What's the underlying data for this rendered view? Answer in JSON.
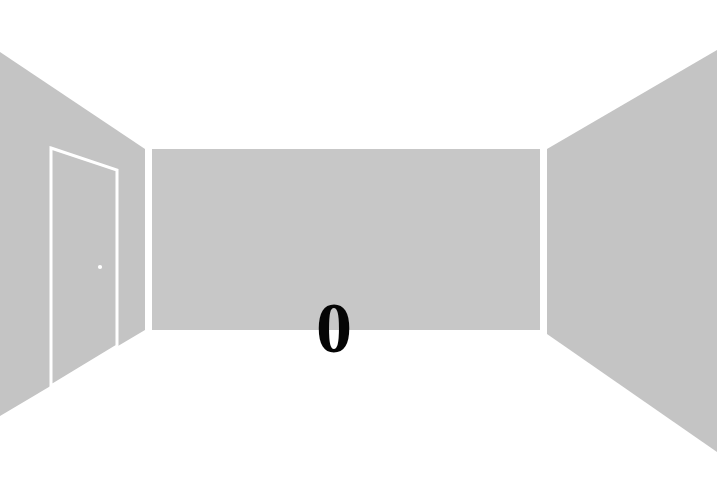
{
  "scene": {
    "title": "Empty room interior perspective",
    "canvas": {
      "width": 717,
      "height": 486
    },
    "background_color": "#ffffff",
    "floor_color": "#ffffff",
    "ceiling_color": "#ffffff"
  },
  "walls": {
    "back": {
      "name": "back-wall",
      "color": "#c7c7c7",
      "points": "152,149 540,149 540,330 152,330"
    },
    "left": {
      "name": "left-wall",
      "color": "#c4c4c4",
      "points": "0,52 145,149 145,330 0,416"
    },
    "right": {
      "name": "right-wall",
      "color": "#c4c4c4",
      "points": "717,50 547,149 547,334 717,452"
    }
  },
  "door": {
    "name": "door",
    "outline_color": "#ffffff",
    "fill_color": "#c4c4c4",
    "stroke_width": 3,
    "points": "51,148 117,170 117,346 51,386",
    "knob": {
      "name": "door-knob",
      "color": "#ffffff",
      "cx": 100,
      "cy": 267,
      "r": 2
    }
  },
  "marking": {
    "name": "floor-marking-letter",
    "text": "0",
    "color": "#050505",
    "left": 316,
    "top": 292,
    "font_size": 72
  }
}
